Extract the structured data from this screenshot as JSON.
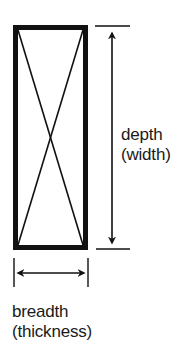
{
  "diagram": {
    "type": "timber cross-section dimension diagram",
    "colors": {
      "stroke": "#111111",
      "background": "#ffffff"
    },
    "section": {
      "shape": "rectangle",
      "marking": "diagonal cross (X)"
    },
    "depth": {
      "term": "depth",
      "alt_term": "(width)",
      "orientation": "vertical",
      "arrow": "double-headed-vertical"
    },
    "breadth": {
      "term": "breadth",
      "alt_term": "(thickness)",
      "orientation": "horizontal",
      "arrow": "double-headed-horizontal"
    }
  }
}
